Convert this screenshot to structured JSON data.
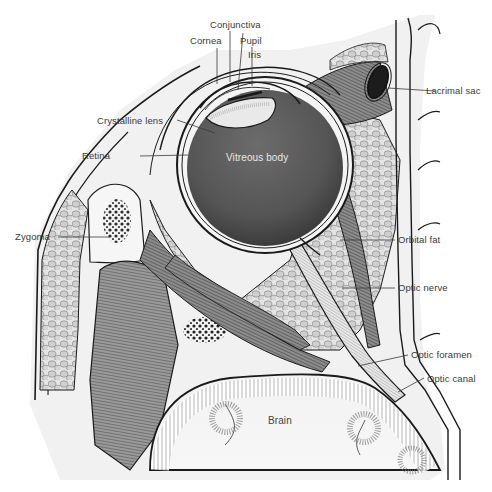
{
  "diagram": {
    "type": "anatomical-illustration",
    "labels": {
      "conjunctiva": "Conjunctiva",
      "cornea": "Cornea",
      "pupil": "Pupil",
      "iris": "Iris",
      "crystalline_lens": "Crystalline lens",
      "retina": "Retina",
      "vitreous_body": "Vitreous body",
      "lacrimal_sac": "Lacrimal sac",
      "zygoma": "Zygoma",
      "orbital_fat": "Orbital fat",
      "optic_nerve": "Optic nerve",
      "optic_foramen": "Optic foramen",
      "optic_canal": "Optic canal",
      "brain": "Brain"
    },
    "colors": {
      "background": "#ffffff",
      "ink": "#1a1a1a",
      "vitreous": "#5a5a5a",
      "fat": "#d9d9d9",
      "muscle": "#7a7a7a",
      "label_text": "#3a3a3a"
    }
  }
}
